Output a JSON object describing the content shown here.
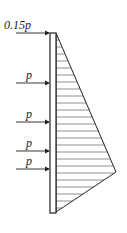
{
  "diagram": {
    "wall": {
      "x": 50,
      "width": 6,
      "top": 33,
      "bottom": 213
    },
    "pressure_triangle": {
      "top": [
        56,
        33
      ],
      "tip": [
        116,
        172
      ],
      "bottom": [
        56,
        212
      ],
      "hatch": "horizontal"
    },
    "loads": [
      {
        "label": "0.15p",
        "y": 33
      },
      {
        "label": "p",
        "y": 83
      },
      {
        "label": "p",
        "y": 122
      },
      {
        "label": "p",
        "y": 151
      },
      {
        "label": "p",
        "y": 169
      }
    ],
    "colors": {
      "line": "#222222",
      "background": "#ffffff"
    }
  }
}
